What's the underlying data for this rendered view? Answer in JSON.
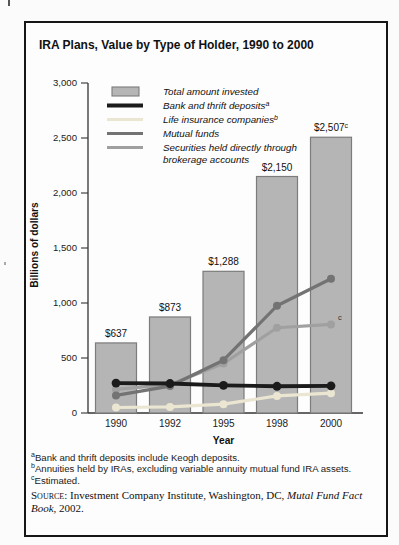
{
  "figure": {
    "border_color": "#161616",
    "background": "#fdfdfd"
  },
  "chart_data": {
    "type": "bar",
    "title": "IRA Plans, Value by Type of Holder, 1990 to 2000",
    "xlabel": "Year",
    "ylabel": "Billions of dollars",
    "ylim": [
      0,
      3000
    ],
    "ytick_interval": 500,
    "ytick_labels": [
      "0",
      "500",
      "1,000",
      "1,500",
      "2,000",
      "2,500",
      "3,000"
    ],
    "grid": "off",
    "legend_position": "top-left-inside",
    "categories": [
      "1990",
      "1992",
      "1995",
      "1998",
      "2000"
    ],
    "bars": {
      "name": "Total amount invested",
      "values": [
        637,
        873,
        1288,
        2150,
        2507
      ],
      "value_labels": [
        "$637",
        "$873",
        "$1,288",
        "$2,150",
        "$2,507"
      ],
      "value_label_sups": [
        "",
        "",
        "",
        "",
        "c"
      ],
      "fill": "#b5b5b5",
      "border": "#7c7c7c"
    },
    "line_series": [
      {
        "name": "Bank and thrift deposits",
        "sup": "a",
        "color": "#1b1b1b",
        "values": [
          272,
          268,
          252,
          243,
          247
        ]
      },
      {
        "name": "Life insurance companies",
        "sup": "b",
        "color": "#ebe6d1",
        "values": [
          50,
          55,
          80,
          155,
          180
        ]
      },
      {
        "name": "Mutual funds",
        "sup": "",
        "color": "#737373",
        "values": [
          160,
          245,
          480,
          975,
          1220
        ]
      },
      {
        "name": "Securities held directly through brokerage accounts",
        "sup": "",
        "name_lines": [
          "Securities held directly through",
          "brokerage accounts"
        ],
        "color": "#a0a0a0",
        "values": [
          215,
          258,
          450,
          775,
          805
        ],
        "end_sup": "c"
      }
    ]
  },
  "footnotes": [
    {
      "sup": "a",
      "text": "Bank and thrift deposits include Keogh deposits."
    },
    {
      "sup": "b",
      "text": "Annuities held by IRAs, excluding variable annuity mutual fund IRA assets."
    },
    {
      "sup": "c",
      "text": "Estimated."
    }
  ],
  "source": {
    "label": "Source:",
    "before_italic": " Investment Company Institute, Washington, DC, ",
    "italic": "Mutal Fund Fact Book,",
    "after_italic": " 2002."
  }
}
